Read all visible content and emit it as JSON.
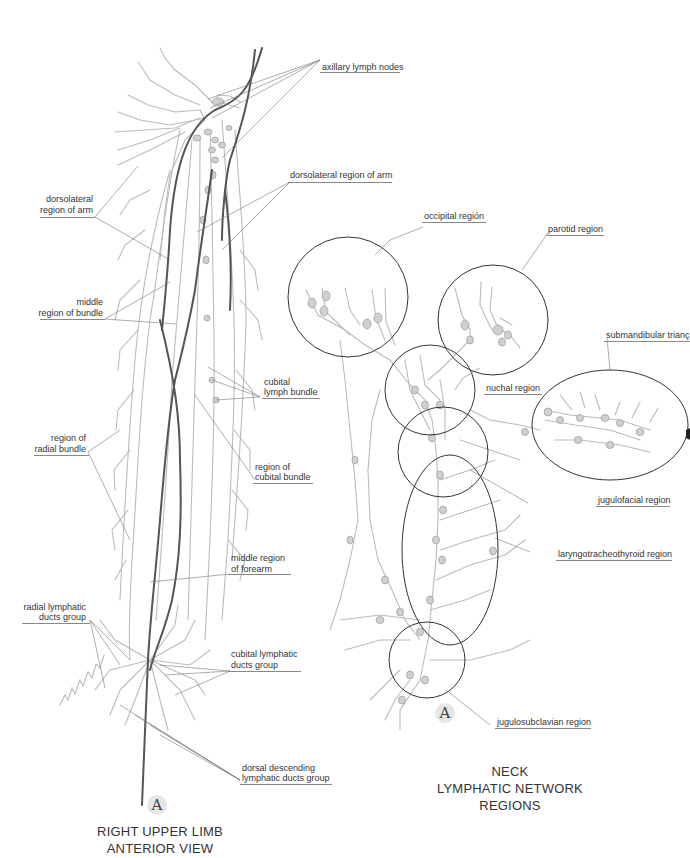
{
  "limb": {
    "letter": "A",
    "title_line1": "RIGHT UPPER LIMB",
    "title_line2": "ANTERIOR VIEW",
    "labels": {
      "axillary": "axillary lymph nodes",
      "dorsolateral_right": "dorsolateral region of arm",
      "dorsolateral_left_1": "dorsolateral",
      "dorsolateral_left_2": "region of arm",
      "middle_bundle_1": "middle",
      "middle_bundle_2": "region of bundle",
      "cubital_lymph_1": "cubital",
      "cubital_lymph_2": "lymph bundle",
      "radial_bundle_1": "region of",
      "radial_bundle_2": "radial bundle",
      "cubital_bundle_1": "region of",
      "cubital_bundle_2": "cubital bundle",
      "middle_forearm_1": "middle region",
      "middle_forearm_2": "of forearm",
      "radial_ducts_1": "radial lymphatic",
      "radial_ducts_2": "ducts group",
      "cubital_ducts_1": "cubital lymphatic",
      "cubital_ducts_2": "ducts group",
      "dorsal_desc_1": "dorsal descending",
      "dorsal_desc_2": "lymphatic ducts group"
    }
  },
  "neck": {
    "letter": "A",
    "title_line1": "NECK",
    "title_line2": "LYMPHATIC NETWORK REGIONS",
    "labels": {
      "occipital": "occipital región",
      "parotid": "parotid region",
      "submandibular": "submandibular trianç",
      "nuchal": "nuchal region",
      "jugulofacial": "jugulofacial region",
      "laryngotracheothyroid": "laryngotracheothyroid region",
      "jugulosubclavian": "jugulosubclavian region"
    }
  },
  "colors": {
    "vessel_light": "#b8b8b8",
    "vessel_dark": "#555555",
    "leader": "#777777",
    "node_fill": "#cfcfcf",
    "text": "#333333"
  }
}
